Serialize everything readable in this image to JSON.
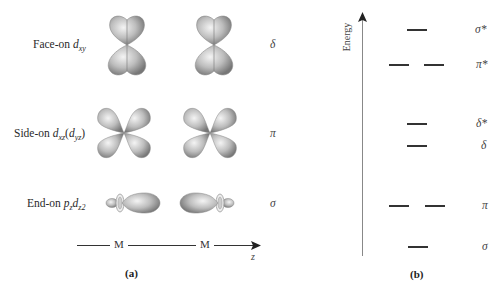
{
  "panel_a": {
    "label": "(a)",
    "rows": [
      {
        "name": "face-on",
        "prefix": "Face-on ",
        "orbital": "d",
        "sub": "xy",
        "suffix": "",
        "bond": "δ"
      },
      {
        "name": "side-on",
        "prefix": "Side-on ",
        "orbital": "d",
        "sub": "xz",
        "paren_orbital": "d",
        "paren_sub": "yz",
        "bond": "π"
      },
      {
        "name": "end-on",
        "prefix": "End-on ",
        "orbital": "p",
        "sub": "z",
        "orbital2": "d",
        "sub2": "z",
        "sup2": "2",
        "bond": "σ"
      }
    ],
    "axis": {
      "atom1": "M",
      "atom2": "M",
      "axis_label": "z"
    }
  },
  "panel_b": {
    "label": "(b)",
    "y_axis_label": "Energy",
    "levels": [
      {
        "label": "σ*",
        "degenerate": 1
      },
      {
        "label": "π*",
        "degenerate": 2
      },
      {
        "label": "δ*",
        "degenerate": 1
      },
      {
        "label": "δ",
        "degenerate": 1
      },
      {
        "label": "π",
        "degenerate": 2
      },
      {
        "label": "σ",
        "degenerate": 1
      }
    ]
  },
  "colors": {
    "lobe_light": "#f2f2f2",
    "lobe_dark": "#7a7a7a",
    "line": "#333333",
    "axis": "#888888"
  }
}
